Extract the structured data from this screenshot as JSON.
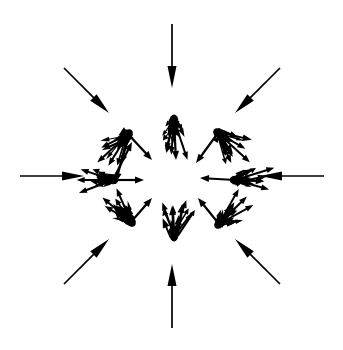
{
  "figure": {
    "background_color": "#ffffff",
    "ink_color": "#000000",
    "width": 343,
    "height": 350,
    "center": {
      "x": 172,
      "y": 176
    }
  },
  "chart_data": {
    "type": "scatter",
    "xlabel": "",
    "ylabel": "",
    "xlim": [
      0,
      343
    ],
    "ylim": [
      0,
      350
    ],
    "grid": false,
    "legend": "none",
    "center": {
      "x": 172,
      "y": 176
    },
    "outer_ring": {
      "name": "outer-arrows",
      "count": 8,
      "radius_outer": 152,
      "radius_inner": 88,
      "direction": "inward",
      "head_length": 22,
      "head_width": 9,
      "shaft_width": 1.7,
      "angles_deg": [
        0,
        45,
        90,
        135,
        180,
        225,
        270,
        315
      ],
      "arrows": [
        {
          "id": "outer-e",
          "angle_deg": 0,
          "tail": {
            "x": 324,
            "y": 176
          },
          "tip": {
            "x": 260,
            "y": 176
          },
          "length": 64
        },
        {
          "id": "outer-ne",
          "angle_deg": 45,
          "tail": {
            "x": 280,
            "y": 68
          },
          "tip": {
            "x": 235,
            "y": 113
          },
          "length": 64
        },
        {
          "id": "outer-n",
          "angle_deg": 90,
          "tail": {
            "x": 172,
            "y": 24
          },
          "tip": {
            "x": 172,
            "y": 88
          },
          "length": 64
        },
        {
          "id": "outer-nw",
          "angle_deg": 135,
          "tail": {
            "x": 64,
            "y": 68
          },
          "tip": {
            "x": 109,
            "y": 113
          },
          "length": 64
        },
        {
          "id": "outer-w",
          "angle_deg": 180,
          "tail": {
            "x": 20,
            "y": 176
          },
          "tip": {
            "x": 84,
            "y": 176
          },
          "length": 64
        },
        {
          "id": "outer-sw",
          "angle_deg": 225,
          "tail": {
            "x": 64,
            "y": 284
          },
          "tip": {
            "x": 109,
            "y": 239
          },
          "length": 64
        },
        {
          "id": "outer-s",
          "angle_deg": 270,
          "tail": {
            "x": 172,
            "y": 328
          },
          "tip": {
            "x": 172,
            "y": 264
          },
          "length": 64
        },
        {
          "id": "outer-se",
          "angle_deg": 315,
          "tail": {
            "x": 280,
            "y": 284
          },
          "tip": {
            "x": 235,
            "y": 239
          },
          "length": 64
        }
      ]
    },
    "inner_ring": {
      "name": "inner-clusters",
      "count": 8,
      "radius": 56,
      "direction": "inward",
      "arrows_per_cluster": 26,
      "fan_spread_deg": 70,
      "arrow_length_range": [
        8,
        34
      ],
      "head_length": 7,
      "head_width": 5,
      "shaft_width": 1.4,
      "clusters": [
        {
          "id": "cluster-nw",
          "angle_deg": 135,
          "center": {
            "x": 128,
            "y": 134
          },
          "mean_direction_deg": 315,
          "arrow_count": 26
        },
        {
          "id": "cluster-n",
          "angle_deg": 90,
          "center": {
            "x": 174,
            "y": 120
          },
          "mean_direction_deg": 270,
          "arrow_count": 26
        },
        {
          "id": "cluster-ne",
          "angle_deg": 45,
          "center": {
            "x": 218,
            "y": 133
          },
          "mean_direction_deg": 225,
          "arrow_count": 26
        },
        {
          "id": "cluster-w",
          "angle_deg": 180,
          "center": {
            "x": 113,
            "y": 180
          },
          "mean_direction_deg": 0,
          "arrow_count": 26
        },
        {
          "id": "cluster-e",
          "angle_deg": 0,
          "center": {
            "x": 235,
            "y": 180
          },
          "mean_direction_deg": 180,
          "arrow_count": 26
        },
        {
          "id": "cluster-sw",
          "angle_deg": 225,
          "center": {
            "x": 131,
            "y": 222
          },
          "mean_direction_deg": 45,
          "arrow_count": 26
        },
        {
          "id": "cluster-s",
          "angle_deg": 270,
          "center": {
            "x": 174,
            "y": 236
          },
          "mean_direction_deg": 90,
          "arrow_count": 26
        },
        {
          "id": "cluster-se",
          "angle_deg": 315,
          "center": {
            "x": 219,
            "y": 224
          },
          "mean_direction_deg": 135,
          "arrow_count": 26
        }
      ]
    },
    "long_links": [
      {
        "id": "link-nw-w",
        "from": {
          "x": 128,
          "y": 134
        },
        "to": {
          "x": 116,
          "y": 182
        }
      },
      {
        "id": "link-nw-se",
        "from": {
          "x": 128,
          "y": 134
        },
        "to": {
          "x": 152,
          "y": 160
        }
      },
      {
        "id": "link-w-e",
        "from": {
          "x": 113,
          "y": 180
        },
        "to": {
          "x": 144,
          "y": 180
        }
      },
      {
        "id": "link-w-ne",
        "from": {
          "x": 113,
          "y": 180
        },
        "to": {
          "x": 132,
          "y": 142
        }
      },
      {
        "id": "link-n-s",
        "from": {
          "x": 174,
          "y": 120
        },
        "to": {
          "x": 176,
          "y": 160
        }
      },
      {
        "id": "link-ne-sw",
        "from": {
          "x": 218,
          "y": 133
        },
        "to": {
          "x": 196,
          "y": 163
        }
      },
      {
        "id": "link-e-w",
        "from": {
          "x": 235,
          "y": 180
        },
        "to": {
          "x": 200,
          "y": 178
        }
      },
      {
        "id": "link-sw-ne",
        "from": {
          "x": 131,
          "y": 222
        },
        "to": {
          "x": 152,
          "y": 198
        }
      },
      {
        "id": "link-s-n",
        "from": {
          "x": 174,
          "y": 236
        },
        "to": {
          "x": 172,
          "y": 206
        }
      },
      {
        "id": "link-se-nw",
        "from": {
          "x": 219,
          "y": 224
        },
        "to": {
          "x": 198,
          "y": 198
        }
      }
    ]
  }
}
